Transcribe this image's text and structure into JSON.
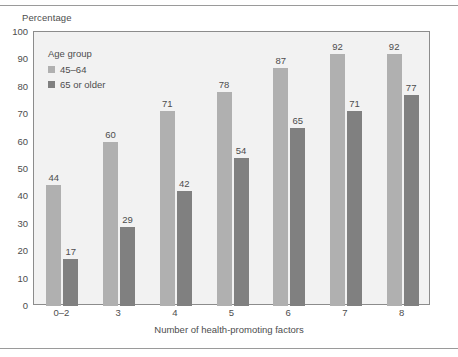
{
  "chart_data": {
    "type": "bar",
    "title": "",
    "ylabel": "Percentage",
    "xlabel": "Number of health-promoting factors",
    "categories": [
      "0–2",
      "3",
      "4",
      "5",
      "6",
      "7",
      "8"
    ],
    "series": [
      {
        "name": "45–64",
        "values": [
          44,
          60,
          71,
          78,
          87,
          92,
          92
        ],
        "color": "#b0b0b0"
      },
      {
        "name": "65 or older",
        "values": [
          17,
          29,
          42,
          54,
          65,
          71,
          77
        ],
        "color": "#808080"
      }
    ],
    "legend_title": "Age group",
    "legend_position": "top-left-inside",
    "ylim": [
      0,
      100
    ],
    "yticks": [
      100,
      90,
      80,
      70,
      60,
      50,
      40,
      30,
      20,
      10,
      0
    ],
    "grid": false,
    "plot_background": "#f2f2f2",
    "frame_color": "#8c8c8c",
    "text_color": "#4d4d4d"
  }
}
